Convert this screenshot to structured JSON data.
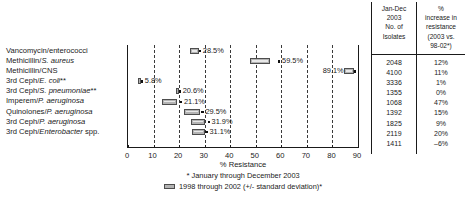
{
  "table": {
    "header_isolates": "Jan-Dec 2003 No. of Isolates",
    "header_isolates_lines": [
      "Jan-Dec",
      "2003",
      "No. of",
      "Isolates"
    ],
    "header_increase": "% increase in resistance (2003 vs. 98-02*)",
    "header_increase_lines": [
      "%",
      "increase in",
      "resistance",
      "(2003 vs.",
      "98-02*)"
    ],
    "isolates": [
      "2048",
      "4100",
      "3336",
      "1355",
      "1068",
      "1392",
      "1825",
      "2119",
      "1411"
    ],
    "increase": [
      "12%",
      "11%",
      "1%",
      "0%",
      "47%",
      "15%",
      "9%",
      "20%",
      "–6%"
    ]
  },
  "axis": {
    "title": "% Resistance",
    "ticks": [
      "0",
      "10",
      "20",
      "30",
      "40",
      "50",
      "60",
      "70",
      "80",
      "90"
    ],
    "min": 0,
    "max": 90
  },
  "footnotes": {
    "line1": "* January through December 2003",
    "line2": "1998 through 2002 (+/- standard deviation)*"
  },
  "chart_data": {
    "type": "bar",
    "title": "",
    "xlabel": "% Resistance",
    "ylabel": "",
    "xlim": [
      0,
      90
    ],
    "grid": true,
    "legend_position": "below",
    "legend": [
      {
        "key": "dot",
        "label": "* January through December 2003"
      },
      {
        "key": "box",
        "label": "1998 through 2002 (+/- standard deviation)*"
      }
    ],
    "categories": [
      "Vancomycin/enterococci",
      "Methicillin/S. aureus",
      "Methicillin/CNS",
      "3rd Ceph/E. coli**",
      "3rd Ceph/S. pneumoniae**",
      "Imperem/P. aeruginosa",
      "Quinolones/P. aeruginosa",
      "3rd Ceph/P. aeruginosa",
      "3rd Ceph/Enterobacter spp."
    ],
    "categories_parts": [
      {
        "plain": "Vancomycin/enterococci",
        "italic": "",
        "tail": ""
      },
      {
        "plain": "Methicillin/",
        "italic": "S. aureus",
        "tail": ""
      },
      {
        "plain": "Methicillin/CNS",
        "italic": "",
        "tail": ""
      },
      {
        "plain": "3rd Ceph/",
        "italic": "E. coli",
        "tail": "**"
      },
      {
        "plain": "3rd Ceph/",
        "italic": "S. pneumoniae",
        "tail": "**"
      },
      {
        "plain": "Imperem/",
        "italic": "P. aeruginosa",
        "tail": ""
      },
      {
        "plain": "Quinolones/",
        "italic": "P. aeruginosa",
        "tail": ""
      },
      {
        "plain": "3rd Ceph/",
        "italic": "P. aeruginosa",
        "tail": ""
      },
      {
        "plain": "3rd Ceph/",
        "italic": "Enterobacter",
        "tail": " spp."
      }
    ],
    "values": [
      28.5,
      59.5,
      89.1,
      5.8,
      20.6,
      21.1,
      29.5,
      31.9,
      31.1
    ],
    "value_labels": [
      "28.5%",
      "59.5%",
      "89.1%",
      "5.8%",
      "20.6%",
      "21.1%",
      "29.5%",
      "31.9%",
      "31.1%"
    ],
    "sd_ranges": [
      [
        24.8,
        28.0
      ],
      [
        48.0,
        56.0
      ],
      [
        85.0,
        89.0
      ],
      [
        4.2,
        5.0
      ],
      [
        19.0,
        20.0
      ],
      [
        13.6,
        19.6
      ],
      [
        22.2,
        28.4
      ],
      [
        25.0,
        30.4
      ],
      [
        25.4,
        30.6
      ]
    ],
    "isolates_2003": [
      2048,
      4100,
      3336,
      1355,
      1068,
      1392,
      1825,
      2119,
      1411
    ],
    "percent_increase": [
      12,
      11,
      1,
      0,
      47,
      15,
      9,
      20,
      -6
    ],
    "series": [
      {
        "name": "1998 through 2002 (+/- standard deviation)",
        "type": "range-box",
        "values": [
          26.4,
          52.0,
          87.0,
          4.6,
          19.5,
          16.6,
          25.3,
          27.7,
          28.0
        ]
      },
      {
        "name": "January through December 2003",
        "type": "point",
        "values": [
          28.5,
          59.5,
          89.1,
          5.8,
          20.6,
          21.1,
          29.5,
          31.9,
          31.1
        ]
      }
    ]
  }
}
